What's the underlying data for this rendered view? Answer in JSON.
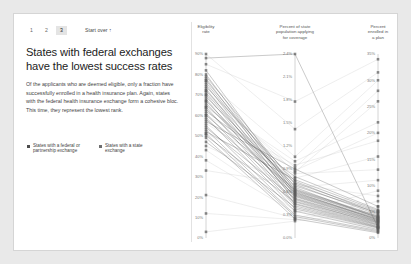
{
  "nav": {
    "steps": [
      {
        "label": "1",
        "active": false
      },
      {
        "label": "2",
        "active": false
      },
      {
        "label": "3",
        "active": true
      }
    ],
    "start_over": "Start over",
    "start_over_arrow": "↑"
  },
  "article": {
    "title": "States with federal exchanges have the lowest success rates",
    "body": "Of the applicants who are deemed eligible, only a fraction have successfully enrolled in a health insurance plan. Again, states with the federal health insurance exchange form a cohesive bloc. This time, they represent the lowest rank."
  },
  "legend": {
    "items": [
      {
        "label": "States with a federal or partnership exchange",
        "color": "#4d4d4d"
      },
      {
        "label": "States with a state exchange",
        "color": "#9a9a9a"
      }
    ]
  },
  "chart_data": {
    "type": "line",
    "title": "States with federal exchanges have the lowest success rates",
    "subtype": "parallel-coordinates",
    "grid": false,
    "legend_position": "left-panel",
    "axes": [
      {
        "name": "eligibility_rate",
        "label": "Eligibility rate",
        "ticks": [
          "90%",
          "80%",
          "70%",
          "60%",
          "50%",
          "40%",
          "30%",
          "20%",
          "10%",
          "0%"
        ],
        "min": 0,
        "max": 90,
        "unit": "%"
      },
      {
        "name": "percent_applying",
        "label": "Percent of state population applying for coverage",
        "ticks": [
          "2.4%",
          "2.1%",
          "1.8%",
          "1.5%",
          "1.2%",
          "0.9%",
          "0.6%",
          "0.3%",
          "0.0%"
        ],
        "min": 0.0,
        "max": 2.4,
        "unit": "%"
      },
      {
        "name": "percent_enrolled",
        "label": "Percent enrolled in a plan",
        "ticks": [
          "35%",
          "30%",
          "25%",
          "20%",
          "15%",
          "10%",
          "5%",
          "0%"
        ],
        "min": 0,
        "max": 35,
        "unit": "%"
      }
    ],
    "series": [
      {
        "name": "state-1",
        "group": "federal",
        "values": [
          88,
          2.4,
          2.0
        ]
      },
      {
        "name": "state-2",
        "group": "federal",
        "values": [
          82,
          0.62,
          4.0
        ]
      },
      {
        "name": "state-3",
        "group": "federal",
        "values": [
          80,
          0.58,
          3.6
        ]
      },
      {
        "name": "state-4",
        "group": "federal",
        "values": [
          79,
          0.7,
          4.4
        ]
      },
      {
        "name": "state-5",
        "group": "federal",
        "values": [
          78,
          0.55,
          3.2
        ]
      },
      {
        "name": "state-6",
        "group": "federal",
        "values": [
          77,
          0.66,
          3.8
        ]
      },
      {
        "name": "state-7",
        "group": "federal",
        "values": [
          76,
          0.6,
          3.4
        ]
      },
      {
        "name": "state-8",
        "group": "federal",
        "values": [
          75,
          0.52,
          3.0
        ]
      },
      {
        "name": "state-9",
        "group": "federal",
        "values": [
          74,
          0.74,
          4.6
        ]
      },
      {
        "name": "state-10",
        "group": "federal",
        "values": [
          73,
          0.48,
          2.8
        ]
      },
      {
        "name": "state-11",
        "group": "federal",
        "values": [
          72,
          0.64,
          4.2
        ]
      },
      {
        "name": "state-12",
        "group": "federal",
        "values": [
          71,
          0.57,
          3.5
        ]
      },
      {
        "name": "state-13",
        "group": "federal",
        "values": [
          70,
          0.5,
          2.6
        ]
      },
      {
        "name": "state-14",
        "group": "federal",
        "values": [
          69,
          0.68,
          4.8
        ]
      },
      {
        "name": "state-15",
        "group": "federal",
        "values": [
          68,
          0.45,
          2.4
        ]
      },
      {
        "name": "state-16",
        "group": "federal",
        "values": [
          67,
          0.61,
          3.9
        ]
      },
      {
        "name": "state-17",
        "group": "federal",
        "values": [
          66,
          0.54,
          3.1
        ]
      },
      {
        "name": "state-18",
        "group": "federal",
        "values": [
          65,
          0.72,
          5.0
        ]
      },
      {
        "name": "state-19",
        "group": "federal",
        "values": [
          64,
          0.44,
          2.2
        ]
      },
      {
        "name": "state-20",
        "group": "federal",
        "values": [
          63,
          0.59,
          3.7
        ]
      },
      {
        "name": "state-21",
        "group": "federal",
        "values": [
          62,
          0.8,
          5.4
        ]
      },
      {
        "name": "state-22",
        "group": "federal",
        "values": [
          61,
          0.42,
          2.1
        ]
      },
      {
        "name": "state-23",
        "group": "federal",
        "values": [
          60,
          0.63,
          4.1
        ]
      },
      {
        "name": "state-24",
        "group": "federal",
        "values": [
          59,
          0.38,
          1.9
        ]
      },
      {
        "name": "state-25",
        "group": "federal",
        "values": [
          58,
          0.56,
          3.3
        ]
      },
      {
        "name": "state-26",
        "group": "federal",
        "values": [
          57,
          0.9,
          6.0
        ]
      },
      {
        "name": "state-27",
        "group": "federal",
        "values": [
          55,
          0.35,
          1.6
        ]
      },
      {
        "name": "state-28",
        "group": "federal",
        "values": [
          54,
          0.51,
          2.9
        ]
      },
      {
        "name": "state-29",
        "group": "federal",
        "values": [
          53,
          0.3,
          1.4
        ]
      },
      {
        "name": "state-30",
        "group": "federal",
        "values": [
          52,
          0.76,
          5.2
        ]
      },
      {
        "name": "state-31",
        "group": "federal",
        "values": [
          51,
          0.28,
          1.2
        ]
      },
      {
        "name": "state-32",
        "group": "federal",
        "values": [
          50,
          0.47,
          2.5
        ]
      },
      {
        "name": "state-33",
        "group": "federal",
        "values": [
          49,
          0.25,
          1.0
        ]
      },
      {
        "name": "state-34",
        "group": "federal",
        "values": [
          47,
          0.4,
          2.0
        ]
      },
      {
        "name": "state-35",
        "group": "state",
        "values": [
          85,
          1.78,
          34.0
        ]
      },
      {
        "name": "state-36",
        "group": "state",
        "values": [
          77,
          1.06,
          30.0
        ]
      },
      {
        "name": "state-37",
        "group": "state",
        "values": [
          72,
          0.86,
          26.0
        ]
      },
      {
        "name": "state-38",
        "group": "state",
        "values": [
          67,
          1.0,
          22.0
        ]
      },
      {
        "name": "state-39",
        "group": "state",
        "values": [
          60,
          0.95,
          18.5
        ]
      },
      {
        "name": "state-40",
        "group": "state",
        "values": [
          56,
          0.78,
          15.5
        ]
      },
      {
        "name": "state-41",
        "group": "state",
        "values": [
          51,
          0.84,
          13.0
        ]
      },
      {
        "name": "state-42",
        "group": "state",
        "values": [
          45,
          0.66,
          11.0
        ]
      },
      {
        "name": "state-43",
        "group": "state",
        "values": [
          38,
          0.33,
          9.0
        ]
      },
      {
        "name": "state-44",
        "group": "state",
        "values": [
          33,
          0.7,
          8.0
        ]
      },
      {
        "name": "state-45",
        "group": "state",
        "values": [
          21,
          0.26,
          7.0
        ]
      },
      {
        "name": "state-46",
        "group": "state",
        "values": [
          12,
          0.24,
          6.0
        ]
      },
      {
        "name": "state-47",
        "group": "state",
        "values": [
          3,
          0.22,
          5.0
        ]
      },
      {
        "name": "state-48",
        "group": "state",
        "values": [
          90,
          1.42,
          31.5
        ]
      },
      {
        "name": "state-49",
        "group": "state",
        "values": [
          70,
          0.92,
          28.0
        ]
      },
      {
        "name": "state-50",
        "group": "state",
        "values": [
          64,
          0.88,
          20.0
        ]
      },
      {
        "name": "state-51",
        "group": "state",
        "values": [
          43,
          0.36,
          1.8
        ]
      }
    ],
    "colors": {
      "federal": "#4d4d4d",
      "state": "#b4b4b4"
    }
  }
}
